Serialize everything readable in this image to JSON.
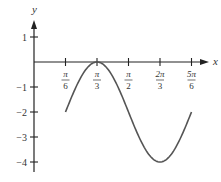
{
  "chart_data": {
    "type": "line",
    "title": "",
    "xlabel": "x",
    "ylabel": "y",
    "function": "y = -2 + 2cos(3(x - π/3))",
    "x_ticks": [
      {
        "value": 0.5236,
        "num": "π",
        "den": "6"
      },
      {
        "value": 1.0472,
        "num": "π",
        "den": "3"
      },
      {
        "value": 1.5708,
        "num": "π",
        "den": "2"
      },
      {
        "value": 2.0944,
        "num": "2π",
        "den": "3"
      },
      {
        "value": 2.618,
        "num": "5π",
        "den": "6"
      }
    ],
    "y_ticks": [
      {
        "value": 1,
        "label": "1"
      },
      {
        "value": -1,
        "label": "−1"
      },
      {
        "value": -2,
        "label": "−2"
      },
      {
        "value": -3,
        "label": "−3"
      },
      {
        "value": -4,
        "label": "−4"
      }
    ],
    "x_domain": [
      0.5236,
      2.618
    ],
    "series": [
      {
        "name": "curve",
        "points": [
          {
            "x": "π/6",
            "y": -2
          },
          {
            "x": "π/3",
            "y": 0
          },
          {
            "x": "π/2",
            "y": -2
          },
          {
            "x": "2π/3",
            "y": -4
          },
          {
            "x": "5π/6",
            "y": -2
          }
        ]
      }
    ],
    "xlim": [
      0,
      2.85
    ],
    "ylim": [
      -4.4,
      1.6
    ],
    "grid": false,
    "legend": null
  },
  "colors": {
    "axis": "#222222",
    "curve": "#555555",
    "text": "#333333"
  }
}
